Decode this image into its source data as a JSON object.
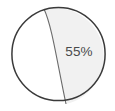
{
  "chart_data": {
    "type": "pie",
    "title": "",
    "subtitle": "",
    "xlabel": "",
    "ylabel": "",
    "grid": false,
    "legend": "none",
    "categories": [
      "Shaded segment",
      "Unshaded segment"
    ],
    "values": [
      55,
      45
    ],
    "units": "%",
    "slices": [
      {
        "label": "55%",
        "value": 55,
        "fill": "#f1f1f1",
        "stroke": "#6b6b6b",
        "label_x": 79,
        "label_y": 56
      },
      {
        "label": "",
        "value": 45,
        "fill": "#ffffff",
        "stroke": "#6b6b6b",
        "label_x": 0,
        "label_y": 0
      }
    ],
    "annotations": [
      "55%"
    ],
    "geometry": {
      "center_x": 58.5,
      "center_y": 54,
      "radius": 47,
      "divider_top_x": 44,
      "divider_top_y": 9,
      "divider_bottom_x": 66,
      "divider_bottom_y": 104,
      "divider_control_x": 57,
      "divider_control_y": 55
    },
    "colors": {
      "outline": "#3a3a3a",
      "divider": "#6b6b6b",
      "slice_shaded": "#f1f1f1",
      "slice_plain": "#ffffff",
      "label_text": "#4a4a4a",
      "background": "#ffffff"
    }
  },
  "figure": {
    "label_55": "55%"
  }
}
